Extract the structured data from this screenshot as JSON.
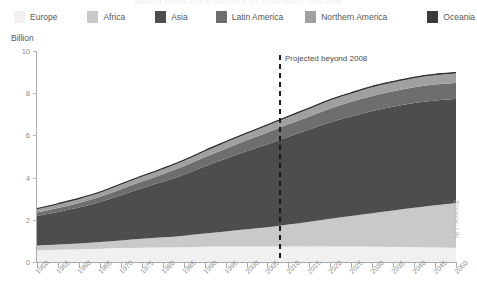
{
  "title": "WORLD POPULATION GROWTH BY CONTINENT, 1950-2050",
  "axis_unit": "Billion",
  "source_note": "Source: UN",
  "projection": {
    "label": "Projected beyond 2008",
    "year": 2008
  },
  "legend": {
    "position": "top",
    "items": [
      {
        "label": "Europe",
        "color": "#f0f0f0"
      },
      {
        "label": "Africa",
        "color": "#c9c9c9"
      },
      {
        "label": "Asia",
        "color": "#4d4d4d"
      },
      {
        "label": "Latin America",
        "color": "#6e6e6e"
      },
      {
        "label": "Northern America",
        "color": "#a0a0a0"
      },
      {
        "label": "Oceania",
        "color": "#3a3a3a"
      }
    ]
  },
  "chart_data": {
    "type": "area",
    "stacked": true,
    "title": "WORLD POPULATION GROWTH BY CONTINENT, 1950-2050",
    "xlabel": "",
    "ylabel": "Billion",
    "ylim": [
      0,
      10
    ],
    "yticks": [
      0,
      2,
      4,
      6,
      8,
      10
    ],
    "xlim": [
      1950,
      2050
    ],
    "grid": false,
    "legend_position": "top",
    "x": [
      1950,
      1955,
      1960,
      1965,
      1970,
      1975,
      1980,
      1985,
      1990,
      1995,
      2000,
      2005,
      2010,
      2015,
      2020,
      2025,
      2030,
      2035,
      2040,
      2045,
      2050
    ],
    "xticks": [
      "1950",
      "1955",
      "1960",
      "1965",
      "1970",
      "1975",
      "1980",
      "1985",
      "1990",
      "1995",
      "2000",
      "2005",
      "2010",
      "2015",
      "2020",
      "2025",
      "2030",
      "2035",
      "2040",
      "2045",
      "2050"
    ],
    "series": [
      {
        "name": "Europe",
        "color": "#f0f0f0",
        "values": [
          0.55,
          0.58,
          0.6,
          0.63,
          0.66,
          0.68,
          0.69,
          0.7,
          0.72,
          0.73,
          0.73,
          0.73,
          0.74,
          0.74,
          0.74,
          0.73,
          0.72,
          0.71,
          0.7,
          0.69,
          0.68
        ]
      },
      {
        "name": "Africa",
        "color": "#c9c9c9",
        "values": [
          0.23,
          0.25,
          0.28,
          0.32,
          0.36,
          0.42,
          0.48,
          0.55,
          0.63,
          0.72,
          0.82,
          0.92,
          1.04,
          1.17,
          1.31,
          1.45,
          1.59,
          1.73,
          1.87,
          2.0,
          2.12
        ]
      },
      {
        "name": "Asia",
        "color": "#4d4d4d",
        "values": [
          1.4,
          1.54,
          1.7,
          1.89,
          2.14,
          2.39,
          2.63,
          2.89,
          3.18,
          3.44,
          3.7,
          3.93,
          4.16,
          4.37,
          4.57,
          4.72,
          4.85,
          4.92,
          4.96,
          4.96,
          4.92
        ]
      },
      {
        "name": "Latin America",
        "color": "#6e6e6e",
        "values": [
          0.17,
          0.19,
          0.22,
          0.25,
          0.29,
          0.32,
          0.36,
          0.4,
          0.44,
          0.48,
          0.52,
          0.56,
          0.59,
          0.62,
          0.66,
          0.69,
          0.71,
          0.73,
          0.75,
          0.76,
          0.76
        ]
      },
      {
        "name": "Northern America",
        "color": "#a0a0a0",
        "values": [
          0.17,
          0.19,
          0.2,
          0.21,
          0.23,
          0.24,
          0.25,
          0.26,
          0.28,
          0.3,
          0.31,
          0.33,
          0.34,
          0.36,
          0.38,
          0.39,
          0.41,
          0.42,
          0.43,
          0.44,
          0.45
        ]
      },
      {
        "name": "Oceania",
        "color": "#3a3a3a",
        "values": [
          0.013,
          0.014,
          0.016,
          0.017,
          0.019,
          0.021,
          0.023,
          0.025,
          0.027,
          0.029,
          0.031,
          0.033,
          0.036,
          0.038,
          0.041,
          0.043,
          0.045,
          0.047,
          0.049,
          0.051,
          0.053
        ]
      }
    ],
    "totals": [
      2.53,
      2.77,
      3.02,
      3.33,
      3.7,
      4.07,
      4.43,
      4.83,
      5.28,
      5.7,
      6.09,
      6.47,
      6.87,
      7.24,
      7.7,
      8.01,
      8.33,
      8.57,
      8.76,
      8.9,
      8.99
    ]
  }
}
